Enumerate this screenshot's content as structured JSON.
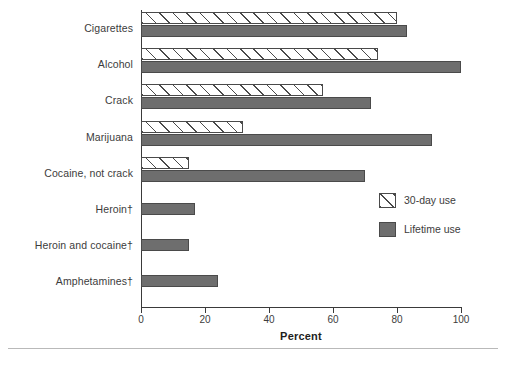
{
  "chart_data": {
    "type": "bar",
    "orientation": "horizontal",
    "title": "",
    "xlabel": "Percent",
    "ylabel": "",
    "xlim": [
      0,
      100
    ],
    "xticks": [
      0,
      20,
      40,
      60,
      80,
      100
    ],
    "grid": false,
    "legend_position": "right-middle",
    "categories": [
      "Cigarettes",
      "Alcohol",
      "Crack",
      "Marijuana",
      "Cocaine, not crack",
      "Heroin†",
      "Heroin and cocaine†",
      "Amphetamines†"
    ],
    "series": [
      {
        "name": "30-day use",
        "style": "hatched",
        "values": [
          80,
          74,
          57,
          32,
          15,
          null,
          null,
          null
        ]
      },
      {
        "name": "Lifetime use",
        "style": "solid",
        "values": [
          83,
          100,
          72,
          91,
          70,
          17,
          15,
          24
        ]
      }
    ]
  },
  "axis": {
    "x_title": "Percent",
    "tick_labels": [
      "0",
      "20",
      "40",
      "60",
      "80",
      "100"
    ]
  },
  "legend": {
    "items": [
      {
        "label": "30-day use",
        "swatch": "hatched-swatch"
      },
      {
        "label": "Lifetime use",
        "swatch": "solid-gray-swatch"
      }
    ]
  },
  "footer": {
    "footnote": ""
  },
  "colors": {
    "solid_bar": "#6e6e6e",
    "bar_outline": "#4a4a4a",
    "axis": "#3a3a3a",
    "text": "#3c3c3c",
    "rule": "#b9b9b9"
  }
}
